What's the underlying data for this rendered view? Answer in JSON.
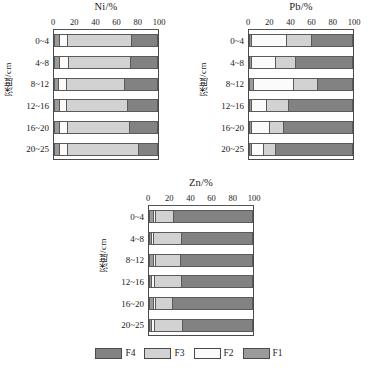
{
  "figure": {
    "y_axis_title": "深度/cm",
    "depth_categories": [
      "0~4",
      "4~8",
      "8~12",
      "12~16",
      "16~20",
      "20~25"
    ],
    "x_ticks": [
      0,
      20,
      40,
      60,
      80,
      100
    ]
  },
  "colors": {
    "F1": "#9b9b9b",
    "F2": "#fbfbfb",
    "F3": "#d2d2d2",
    "F4": "#828282",
    "axis": "#4a4a4a"
  },
  "legend": {
    "items": [
      {
        "label": "F4",
        "color_key": "F4"
      },
      {
        "label": "F3",
        "color_key": "F3"
      },
      {
        "label": "F2",
        "color_key": "F2"
      },
      {
        "label": "F1",
        "color_key": "F1"
      }
    ]
  },
  "chart_data": [
    {
      "id": "ni",
      "type": "bar",
      "orientation": "horizontal",
      "stacked": true,
      "title": "Ni/%",
      "xlabel": "Ni/%",
      "ylabel": "深度/cm",
      "xlim": [
        0,
        100
      ],
      "grid": false,
      "legend_position": "bottom-figure",
      "categories": [
        "0~4",
        "4~8",
        "8~12",
        "12~16",
        "16~20",
        "20~25"
      ],
      "series": [
        {
          "name": "F1",
          "values": [
            4,
            4,
            3,
            4,
            4,
            4
          ]
        },
        {
          "name": "F2",
          "values": [
            8,
            9,
            8,
            7,
            8,
            8
          ]
        },
        {
          "name": "F3",
          "values": [
            63,
            61,
            57,
            60,
            61,
            69
          ]
        },
        {
          "name": "F4",
          "values": [
            25,
            26,
            32,
            29,
            27,
            19
          ]
        }
      ]
    },
    {
      "id": "pb",
      "type": "bar",
      "orientation": "horizontal",
      "stacked": true,
      "title": "Pb/%",
      "xlabel": "Pb/%",
      "ylabel": "深度/cm",
      "xlim": [
        0,
        100
      ],
      "grid": false,
      "legend_position": "bottom-figure",
      "categories": [
        "0~4",
        "4~8",
        "8~12",
        "12~16",
        "16~20",
        "20~25"
      ],
      "series": [
        {
          "name": "F1",
          "values": [
            1,
            1,
            3,
            1,
            1,
            1
          ]
        },
        {
          "name": "F2",
          "values": [
            34,
            24,
            39,
            15,
            18,
            12
          ]
        },
        {
          "name": "F3",
          "values": [
            25,
            19,
            24,
            21,
            13,
            12
          ]
        },
        {
          "name": "F4",
          "values": [
            40,
            56,
            34,
            63,
            68,
            75
          ]
        }
      ]
    },
    {
      "id": "zn",
      "type": "bar",
      "orientation": "horizontal",
      "stacked": true,
      "title": "Zn/%",
      "xlabel": "Zn/%",
      "ylabel": "深度/cm",
      "xlim": [
        0,
        100
      ],
      "grid": false,
      "legend_position": "bottom-figure",
      "categories": [
        "0~4",
        "4~8",
        "8~12",
        "12~16",
        "16~20",
        "20~25"
      ],
      "series": [
        {
          "name": "F1",
          "values": [
            3,
            1,
            3,
            1,
            3,
            1
          ]
        },
        {
          "name": "F2",
          "values": [
            2,
            2,
            2,
            3,
            2,
            3
          ]
        },
        {
          "name": "F3",
          "values": [
            18,
            27,
            24,
            26,
            17,
            27
          ]
        },
        {
          "name": "F4",
          "values": [
            77,
            70,
            71,
            70,
            78,
            69
          ]
        }
      ]
    }
  ]
}
